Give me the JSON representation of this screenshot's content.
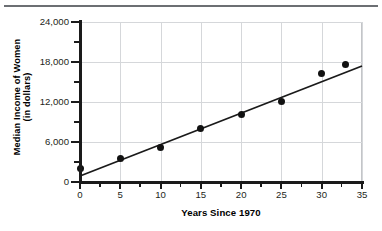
{
  "chart_data": {
    "type": "scatter",
    "title": "",
    "xlabel": "Years Since 1970",
    "ylabel_lines": [
      "Median Income of Women",
      "(in dollars)"
    ],
    "ylabel": "Median Income of Women (in dollars)",
    "xlim": [
      0,
      35
    ],
    "ylim": [
      0,
      24000
    ],
    "grid": true,
    "legend": "none",
    "x_ticks": [
      0,
      5,
      10,
      15,
      20,
      25,
      30,
      35
    ],
    "x_tick_labels": [
      "0",
      "5",
      "10",
      "15",
      "20",
      "25",
      "30",
      "35"
    ],
    "x_minor_ticks": [
      2.5,
      7.5,
      12.5,
      17.5,
      22.5,
      27.5,
      32.5
    ],
    "y_ticks": [
      0,
      6000,
      12000,
      18000,
      24000
    ],
    "y_tick_labels": [
      "0",
      "6,000",
      "12,000",
      "18,000",
      "24,000"
    ],
    "y_minor_ticks": [
      3000,
      9000,
      15000,
      21000
    ],
    "points": [
      {
        "x": 0,
        "y": 2000
      },
      {
        "x": 5,
        "y": 3600
      },
      {
        "x": 10,
        "y": 5200
      },
      {
        "x": 15,
        "y": 8100
      },
      {
        "x": 20,
        "y": 10100
      },
      {
        "x": 25,
        "y": 12100
      },
      {
        "x": 30,
        "y": 16300
      },
      {
        "x": 33,
        "y": 17700
      }
    ],
    "trend_line": {
      "x_start": 0,
      "y_start": 900,
      "x_end": 35,
      "y_end": 17400
    },
    "colors": {
      "point": "#111111",
      "line": "#1a1a1a",
      "grid": "#d5d7da",
      "axis": "#1a1a1a",
      "text": "#231f20",
      "rule": "#6c6f73"
    }
  }
}
